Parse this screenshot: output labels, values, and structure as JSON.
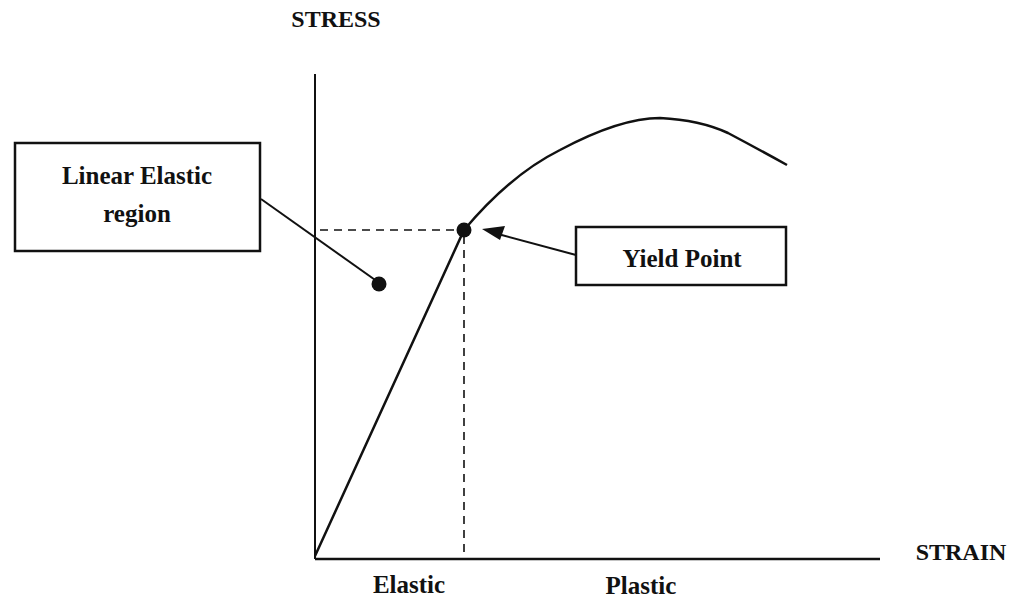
{
  "diagram": {
    "type": "stress-strain curve",
    "y_axis_label": "STRESS",
    "x_axis_label": "STRAIN",
    "region_labels": [
      "Elastic",
      "Plastic"
    ],
    "callouts": {
      "linear_elastic": {
        "line1": "Linear Elastic",
        "line2": "region"
      },
      "yield_point": {
        "label": "Yield Point"
      }
    },
    "colors": {
      "stroke": "#111111",
      "background": "#ffffff"
    }
  }
}
